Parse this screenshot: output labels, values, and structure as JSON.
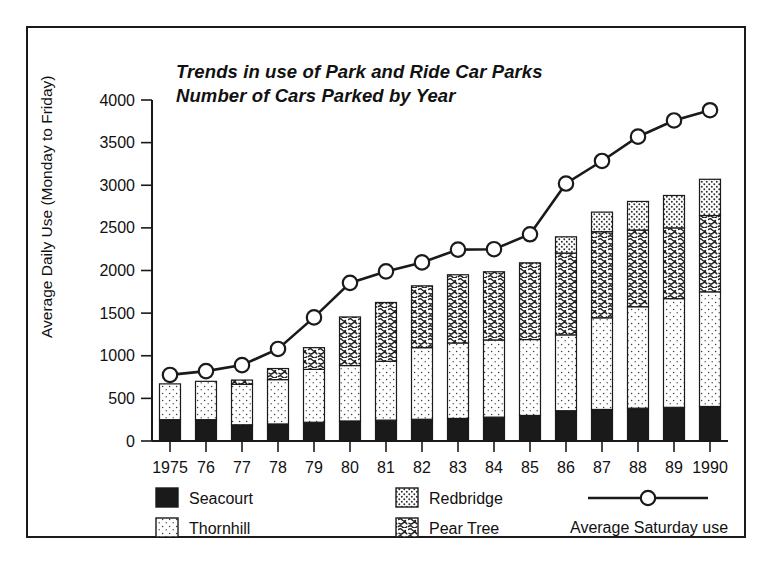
{
  "chart_data": {
    "type": "bar",
    "subtype": "stacked-bar-with-line-overlay",
    "title": "Trends in use of Park and Ride Car Parks",
    "subtitle": "Number of Cars Parked by Year",
    "xlabel": "",
    "ylabel": "Average Daily Use (Monday to Friday)",
    "ylim": [
      0,
      4000
    ],
    "ytick_step": 500,
    "yticks": [
      0,
      500,
      1000,
      1500,
      2000,
      2500,
      3000,
      3500,
      4000
    ],
    "grid": false,
    "legend_position": "bottom",
    "categories": [
      "1975",
      "76",
      "77",
      "78",
      "79",
      "80",
      "81",
      "82",
      "83",
      "84",
      "85",
      "86",
      "87",
      "88",
      "89",
      "1990"
    ],
    "series": [
      {
        "name": "Seacourt",
        "pattern": "solid-black",
        "color": "#1a1a1a",
        "values": [
          250,
          250,
          190,
          200,
          220,
          235,
          245,
          255,
          265,
          280,
          300,
          355,
          370,
          385,
          395,
          405
        ]
      },
      {
        "name": "Thornhill",
        "pattern": "light-dots",
        "color": "#fbfbfb",
        "values": [
          420,
          450,
          475,
          520,
          620,
          650,
          690,
          840,
          885,
          905,
          890,
          890,
          1075,
          1190,
          1275,
          1345
        ]
      },
      {
        "name": "Pear Tree",
        "pattern": "dense-squiggle",
        "color": "#ffffff",
        "values": [
          0,
          0,
          50,
          130,
          255,
          570,
          690,
          725,
          800,
          800,
          900,
          960,
          1010,
          900,
          830,
          895
        ]
      },
      {
        "name": "Redbridge",
        "pattern": "medium-dots",
        "color": "#fdfdfd",
        "values": [
          0,
          0,
          0,
          0,
          0,
          0,
          0,
          0,
          0,
          0,
          0,
          190,
          230,
          335,
          380,
          425
        ]
      }
    ],
    "line_series": {
      "name": "Average Saturday use",
      "marker": "open-circle",
      "color": "#1a1a1a",
      "values": [
        775,
        820,
        890,
        1080,
        1450,
        1855,
        1990,
        2095,
        2245,
        2250,
        2425,
        3020,
        3285,
        3570,
        3760,
        3880
      ]
    },
    "bar_totals": [
      670,
      700,
      715,
      850,
      1095,
      1455,
      1625,
      1820,
      1950,
      1985,
      2090,
      2395,
      2685,
      2810,
      2880,
      3070
    ]
  },
  "legend": {
    "items": [
      {
        "label": "Seacourt",
        "swatch": "solid-black"
      },
      {
        "label": "Thornhill",
        "swatch": "light-dots"
      },
      {
        "label": "Redbridge",
        "swatch": "medium-dots"
      },
      {
        "label": "Pear Tree",
        "swatch": "dense-squiggle"
      },
      {
        "label": "Average Saturday use",
        "swatch": "line-with-circle"
      }
    ]
  }
}
